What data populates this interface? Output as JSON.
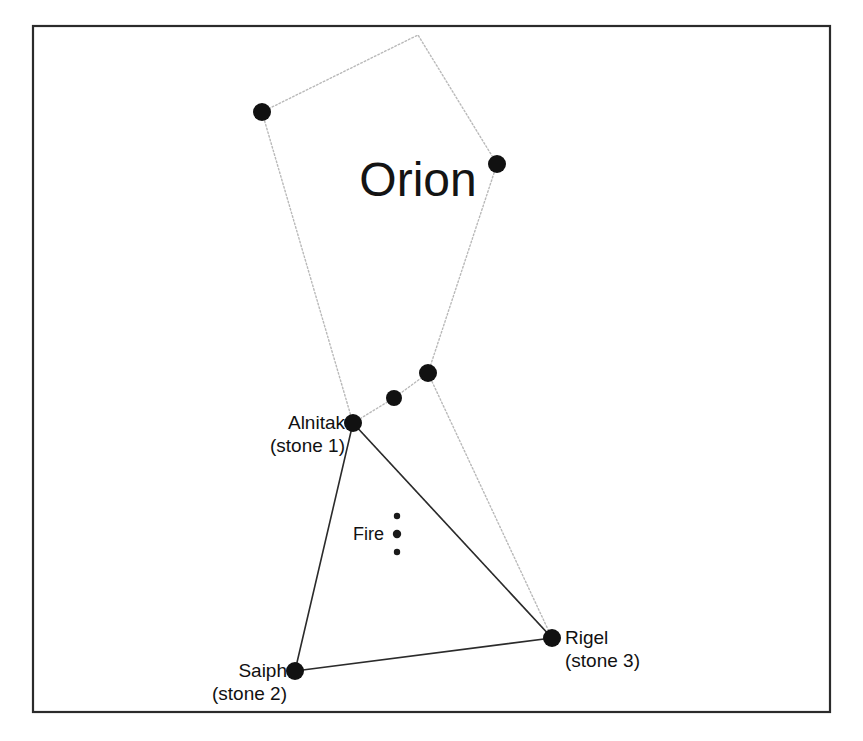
{
  "figure": {
    "title": "Orion",
    "frame": {
      "x": 33,
      "y": 26,
      "width": 797,
      "height": 686
    },
    "background_color": "#ffffff",
    "frame_color": "#2b2b2b",
    "dotted_link_color": "#b9b9b9",
    "solid_link_color": "#2b2b2b",
    "star_color": "#111111"
  },
  "title_label": {
    "text": "Orion",
    "x": 418,
    "y": 196
  },
  "stars": [
    {
      "id": "shoulder-left",
      "name": "",
      "x": 262,
      "y": 112,
      "r": 9
    },
    {
      "id": "shoulder-right",
      "name": "",
      "x": 497,
      "y": 164,
      "r": 9
    },
    {
      "id": "belt-upper",
      "name": "",
      "x": 428,
      "y": 373,
      "r": 9
    },
    {
      "id": "belt-middle",
      "name": "",
      "x": 394,
      "y": 398,
      "r": 8
    },
    {
      "id": "alnitak",
      "name": "Alnitak",
      "x": 353,
      "y": 423,
      "r": 9
    },
    {
      "id": "saiph",
      "name": "Saiph",
      "x": 295,
      "y": 671,
      "r": 9
    },
    {
      "id": "rigel",
      "name": "Rigel",
      "x": 552,
      "y": 638,
      "r": 9
    }
  ],
  "star_labels": [
    {
      "id": "alnitak-label",
      "line1": "Alnitak",
      "line2": "(stone 1)",
      "x": 345,
      "y": 429,
      "align": "end"
    },
    {
      "id": "saiph-label",
      "line1": "Saiph",
      "line2": "(stone 2)",
      "x": 287,
      "y": 677,
      "align": "end"
    },
    {
      "id": "rigel-label",
      "line1": "Rigel",
      "line2": "(stone 3)",
      "x": 565,
      "y": 644,
      "align": "start"
    }
  ],
  "fire_marker": {
    "label": "Fire",
    "label_x": 384,
    "label_y": 540,
    "dots": [
      {
        "x": 397,
        "y": 516,
        "r": 3.2
      },
      {
        "x": 397,
        "y": 534,
        "r": 4.2
      },
      {
        "x": 397,
        "y": 552,
        "r": 3.2
      }
    ]
  },
  "outline_path": {
    "description": "dotted constellation outline",
    "points": "262,112 418,35 497,164 428,373 552,638 353,423 262,112"
  },
  "dotted_segments": [
    {
      "id": "belt-upper-to-belt-middle",
      "x1": 428,
      "y1": 373,
      "x2": 394,
      "y2": 398
    },
    {
      "id": "belt-middle-to-alnitak",
      "x1": 394,
      "y1": 398,
      "x2": 353,
      "y2": 423
    }
  ],
  "solid_segments": [
    {
      "id": "alnitak-to-saiph",
      "x1": 353,
      "y1": 423,
      "x2": 295,
      "y2": 671
    },
    {
      "id": "alnitak-to-rigel",
      "x1": 353,
      "y1": 423,
      "x2": 552,
      "y2": 638
    },
    {
      "id": "saiph-to-rigel",
      "x1": 295,
      "y1": 671,
      "x2": 552,
      "y2": 638
    }
  ]
}
